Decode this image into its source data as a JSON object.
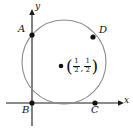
{
  "figure": {
    "axes": {
      "x_label": "x",
      "y_label": "y",
      "origin_px": [
        32,
        103
      ]
    },
    "colors": {
      "circle_stroke": "#8c8c8c",
      "axis_stroke": "#1a1a1a",
      "point_fill": "#111111",
      "background": "#ffffff",
      "text": "#111111"
    },
    "circle": {
      "center_px": [
        64,
        62
      ],
      "radius_px": 42,
      "center_math": "(1/2, 1/2)"
    },
    "center_point": {
      "label_open_paren": "(",
      "label_close_paren": ")",
      "x_numerator": "1",
      "x_denominator": "2",
      "comma": ",",
      "y_numerator": "1",
      "y_denominator": "2"
    },
    "points": [
      {
        "name": "A",
        "label": "A",
        "cx": 32,
        "cy": 35,
        "label_x": 18,
        "label_y": 24
      },
      {
        "name": "B",
        "label": "B",
        "cx": 32,
        "cy": 103,
        "label_x": 22,
        "label_y": 106
      },
      {
        "name": "C",
        "label": "C",
        "cx": 95,
        "cy": 103,
        "label_x": 91,
        "label_y": 106
      },
      {
        "name": "D",
        "label": "D",
        "cx": 93,
        "cy": 37,
        "label_x": 99,
        "label_y": 25
      }
    ]
  }
}
